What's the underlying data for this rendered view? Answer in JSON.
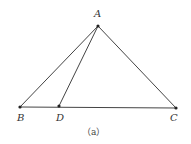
{
  "diagram": {
    "caption": "（a）",
    "points": {
      "A": {
        "label": "A",
        "x": 98,
        "y": 26
      },
      "B": {
        "label": "B",
        "x": 20,
        "y": 107
      },
      "D": {
        "label": "D",
        "x": 59,
        "y": 106
      },
      "C": {
        "label": "C",
        "x": 176,
        "y": 108
      }
    },
    "segments": [
      "AB",
      "AC",
      "AD",
      "BC"
    ],
    "line_color": "#444444"
  }
}
